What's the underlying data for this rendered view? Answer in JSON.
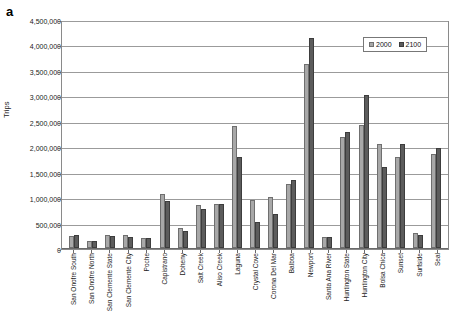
{
  "panel": {
    "label": "a"
  },
  "legend": {
    "entries": [
      {
        "label": "2000",
        "color": "#a8a8a8"
      },
      {
        "label": "2100",
        "color": "#5c5c5c"
      }
    ]
  },
  "axes": {
    "ylabel": "Trips",
    "yticks": [
      "0",
      "500,000",
      "1,000,000",
      "1,500,000",
      "2,000,000",
      "2,500,000",
      "3,000,000",
      "3,500,000",
      "4,000,000",
      "4,500,000"
    ]
  },
  "chart_data": {
    "type": "bar",
    "title": "",
    "xlabel": "",
    "ylabel": "Trips",
    "ylim": [
      0,
      4500000
    ],
    "grid": true,
    "legend_position": "top-right",
    "categories": [
      "San Onofre South",
      "San Onofre North",
      "San Clemente State",
      "San Clemente City",
      "Poche",
      "Capistrano",
      "Doheny",
      "Salt Creek",
      "Aliso Creek",
      "Laguna",
      "Crystal Cove",
      "Corona Del Mar",
      "Balboa",
      "Newport",
      "Santa Ana River",
      "Huntington State",
      "Huntington City",
      "Bolsa Chica",
      "Sunset",
      "Surfside",
      "Seal"
    ],
    "series": [
      {
        "name": "2000",
        "color": "#a8a8a8",
        "values": [
          240000,
          130000,
          250000,
          250000,
          200000,
          1070000,
          400000,
          850000,
          860000,
          2390000,
          940000,
          1000000,
          1250000,
          3620000,
          220000,
          2190000,
          2420000,
          2050000,
          1780000,
          290000,
          1850000
        ]
      },
      {
        "name": "2100",
        "color": "#5c5c5c",
        "values": [
          250000,
          135000,
          230000,
          210000,
          200000,
          930000,
          330000,
          760000,
          870000,
          1790000,
          510000,
          660000,
          1330000,
          4120000,
          225000,
          2280000,
          3010000,
          1600000,
          2050000,
          260000,
          1960000
        ]
      }
    ]
  }
}
